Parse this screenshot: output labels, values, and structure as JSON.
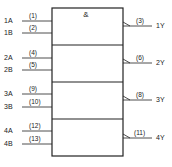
{
  "box_symbol": "&",
  "gates": [
    {
      "inputs": [
        {
          "name": "1A",
          "pin": "(1)"
        },
        {
          "name": "1B",
          "pin": "(2)"
        }
      ],
      "output": {
        "name": "1Y",
        "pin": "(3)"
      }
    },
    {
      "inputs": [
        {
          "name": "2A",
          "pin": "(4)"
        },
        {
          "name": "2B",
          "pin": "(5)"
        }
      ],
      "output": {
        "name": "2Y",
        "pin": "(6)"
      }
    },
    {
      "inputs": [
        {
          "name": "3A",
          "pin": "(9)"
        },
        {
          "name": "3B",
          "pin": "(10)"
        }
      ],
      "output": {
        "name": "3Y",
        "pin": "(8)"
      }
    },
    {
      "inputs": [
        {
          "name": "4A",
          "pin": "(12)"
        },
        {
          "name": "4B",
          "pin": "(13)"
        }
      ],
      "output": {
        "name": "4Y",
        "pin": "(11)"
      }
    }
  ],
  "colors": {
    "line": "#222222",
    "background": "#ffffff"
  }
}
